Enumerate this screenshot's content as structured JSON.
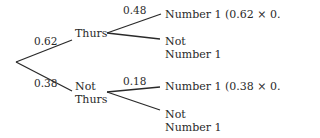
{
  "diagram": {
    "type": "probability-tree",
    "first_level": [
      {
        "event": "Thurs",
        "probability": "0.62",
        "second_level": [
          {
            "event": "Number 1 (0.62 × 0.48)",
            "probability": "0.48"
          },
          {
            "event_line1": "Not",
            "event_line2": "Number 1",
            "probability": ""
          }
        ]
      },
      {
        "event_line1": "Not",
        "event_line2": "Thurs",
        "probability": "0.38",
        "second_level": [
          {
            "event": "Number 1 (0.38 × 0.18)",
            "probability": "0.18"
          },
          {
            "event_line1": "Not",
            "event_line2": "Number 1",
            "probability": ""
          }
        ]
      }
    ]
  }
}
